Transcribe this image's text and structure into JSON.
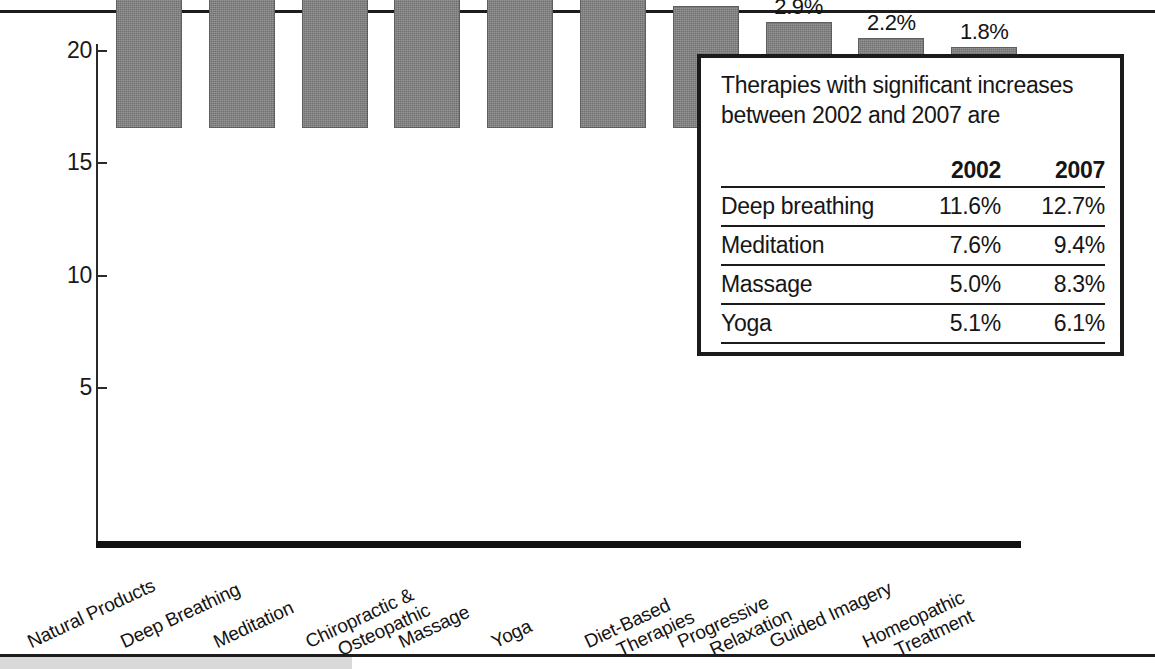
{
  "chart_data": {
    "type": "bar",
    "title": "",
    "xlabel": "",
    "ylabel": "",
    "ylim": [
      0,
      21.5
    ],
    "grid": false,
    "legend": "none",
    "yticks": [
      5,
      10,
      15,
      20
    ],
    "ytick_labels": [
      "5",
      "10",
      "15",
      "20"
    ],
    "categories": [
      "Natural Products",
      "Deep Breathing",
      "Meditation",
      "Chiropractic & Osteopathic",
      "Massage",
      "Yoga",
      "Diet-Based Therapies",
      "Progressive Relaxation",
      "Guided Imagery",
      "Homeopathic Treatment"
    ],
    "category_lines": [
      [
        "Natural Products"
      ],
      [
        "Deep Breathing"
      ],
      [
        "Meditation"
      ],
      [
        "Chiropractic &",
        "Osteopathic"
      ],
      [
        "Massage"
      ],
      [
        "Yoga"
      ],
      [
        "Diet-Based",
        "Therapies"
      ],
      [
        "Progressive",
        "Relaxation"
      ],
      [
        "Guided Imagery"
      ],
      [
        "Homeopathic",
        "Treatment"
      ]
    ],
    "values": [
      17.7,
      12.7,
      9.4,
      8.6,
      8.3,
      6.1,
      3.6,
      2.9,
      2.2,
      1.8
    ],
    "value_labels": [
      "17.7%",
      "12.7%",
      "9.4%",
      "8.6%",
      "8.3%",
      "6.1%",
      "3.6%",
      "2.9%",
      "2.2%",
      "1.8%"
    ],
    "bar_color": "#7e7e7e",
    "axis_color": "#1b1b1b"
  },
  "inset": {
    "title": "Therapies with significant increases between 2002 and 2007 are",
    "columns": [
      "",
      "2002",
      "2007"
    ],
    "rows": [
      {
        "therapy": "Deep breathing",
        "y2002": "11.6%",
        "y2007": "12.7%"
      },
      {
        "therapy": "Meditation",
        "y2002": "7.6%",
        "y2007": "9.4%"
      },
      {
        "therapy": "Massage",
        "y2002": "5.0%",
        "y2007": "8.3%"
      },
      {
        "therapy": "Yoga",
        "y2002": "5.1%",
        "y2007": "6.1%"
      }
    ]
  }
}
